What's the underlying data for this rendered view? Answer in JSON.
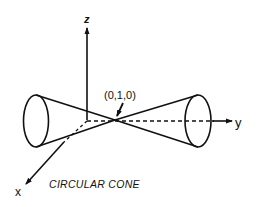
{
  "diagram": {
    "title": "CIRCULAR CONE",
    "axes": {
      "x_label": "x",
      "y_label": "y",
      "z_label": "z"
    },
    "apex_label": "(0,1,0)",
    "colors": {
      "stroke": "#111111",
      "background": "#ffffff"
    }
  }
}
